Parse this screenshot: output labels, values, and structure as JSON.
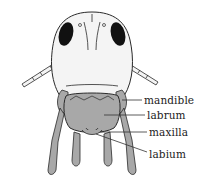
{
  "diagram": {
    "colors": {
      "outline": "#2a2a2a",
      "head_fill": "#f4f4f4",
      "mouthpart_fill": "#a8a8a8",
      "eye_fill": "#111111",
      "leader_line": "#333333"
    },
    "labels": [
      {
        "id": "mandible",
        "text": "mandible"
      },
      {
        "id": "labrum",
        "text": "labrum"
      },
      {
        "id": "maxilla",
        "text": "maxilla"
      },
      {
        "id": "labium",
        "text": "labium"
      }
    ]
  }
}
